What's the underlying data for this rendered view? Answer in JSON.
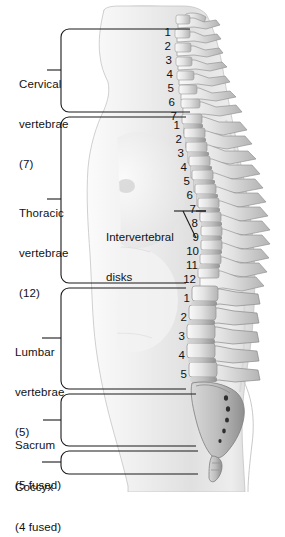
{
  "figure": {
    "background": "#ffffff",
    "line_color": "#1a1a1a",
    "bone_light": "#f2f2f2",
    "bone_mid": "#c9c9c9",
    "bone_dark": "#9a9a9a",
    "body_tint": "#e9e9e9"
  },
  "labels": [
    {
      "name": "cervical",
      "line1": "Cervical",
      "line2": "vertebrae",
      "line3": "(7)"
    },
    {
      "name": "thoracic",
      "line1": "Thoracic",
      "line2": "vertebrae",
      "line3": "(12)"
    },
    {
      "name": "lumbar",
      "line1": "Lumbar",
      "line2": "vertebrae",
      "line3": "(5)"
    },
    {
      "name": "sacrum",
      "line1": "Sacrum",
      "line2": "(5 fused)",
      "line3": ""
    },
    {
      "name": "coccyx",
      "line1": "Coccyx",
      "line2": "(4 fused)",
      "line3": ""
    }
  ],
  "callout": {
    "line1": "Intervertebral",
    "line2": "disks"
  },
  "numbering": {
    "cervical": [
      "1",
      "2",
      "3",
      "4",
      "5",
      "6",
      "7"
    ],
    "thoracic": [
      "1",
      "2",
      "3",
      "4",
      "5",
      "6",
      "7",
      "8",
      "9",
      "10",
      "11",
      "12"
    ],
    "lumbar": [
      "1",
      "2",
      "3",
      "4",
      "5"
    ]
  },
  "counts": {
    "cervical": 7,
    "thoracic": 12,
    "lumbar": 5,
    "sacrum_fused": 5,
    "coccyx_fused": 4
  }
}
